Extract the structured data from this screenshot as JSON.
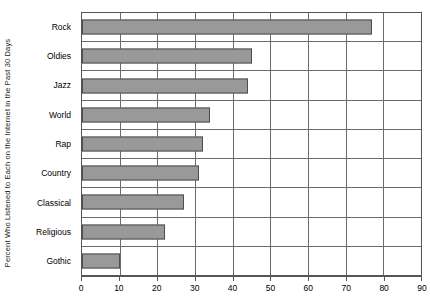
{
  "chart_data": {
    "type": "bar",
    "orientation": "horizontal",
    "title": "",
    "xlabel": "",
    "ylabel": "Percent Who Listened to Each on the Internet in the Past 30 Days",
    "categories": [
      "Rock",
      "Oldies",
      "Jazz",
      "World",
      "Rap",
      "Country",
      "Classical",
      "Religious",
      "Gothic"
    ],
    "values": [
      77,
      45,
      44,
      34,
      32,
      31,
      27,
      22,
      10
    ],
    "xlim": [
      0,
      90
    ],
    "xticks": [
      0,
      10,
      20,
      30,
      40,
      50,
      60,
      70,
      80,
      90
    ],
    "xticklabels": [
      "0",
      "10",
      "20",
      "30",
      "40",
      "50",
      "60",
      "70",
      "80",
      "90"
    ],
    "grid": "vertical-and-row-separators",
    "legend": "none",
    "bar_color": "#999999",
    "bar_edge_color": "#4d4d4d",
    "axis_color": "#555555",
    "gridline_color": "#6b6b6b"
  },
  "axes": {
    "y_title": "Percent Who Listened to Each on the Internet in the Past 30 Days",
    "x_caption": ""
  }
}
